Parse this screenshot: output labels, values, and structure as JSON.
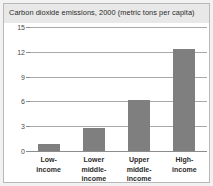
{
  "chart_data": {
    "type": "bar",
    "title": "Carbon dioxide emissions, 2000 (metric tons per capita)",
    "xlabel": "",
    "ylabel": "",
    "ylim": [
      0,
      15
    ],
    "yticks": [
      0,
      3,
      6,
      9,
      12,
      15
    ],
    "ytick_labels": [
      "0",
      "3",
      "6",
      "9",
      "12",
      "15"
    ],
    "grid": true,
    "legend": "none",
    "bar_color": "#7f7f7f",
    "categories": [
      "Low-income",
      "Lower middle-income",
      "Upper middle-income",
      "High-income"
    ],
    "category_lines": [
      [
        "Low-",
        "income"
      ],
      [
        "Lower",
        "middle-",
        "income"
      ],
      [
        "Upper",
        "middle-",
        "income"
      ],
      [
        "High-",
        "income"
      ]
    ],
    "values": [
      0.8,
      2.8,
      6.2,
      12.3
    ]
  },
  "figure": {
    "title_band_color": "#e8e8e8",
    "background_color": "#ffffff",
    "page_background": "#f2f2f2",
    "border_color": "#b8b8b8",
    "gridline_color": "#a9a9a9"
  }
}
